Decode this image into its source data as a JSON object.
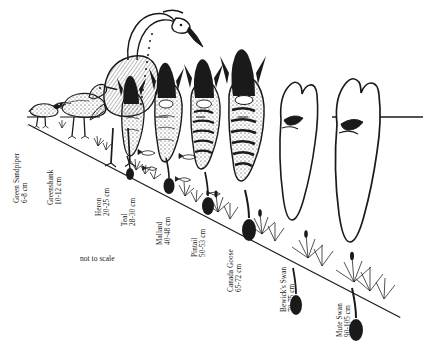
{
  "figure": {
    "note": "not to scale",
    "note_label": "scale-note",
    "ink_color": "#1a1a1a",
    "background_color": "#ffffff"
  },
  "birds": [
    {
      "id": "green-sandpiper",
      "name": "Green Sandpiper",
      "size": "6-8 cm",
      "size_min_cm": 6,
      "size_max_cm": 8,
      "order": 1
    },
    {
      "id": "greenshank",
      "name": "Greenshank",
      "size": "10-12 cm",
      "size_min_cm": 10,
      "size_max_cm": 12,
      "order": 2
    },
    {
      "id": "heron",
      "name": "Heron",
      "size": "20-25 cm",
      "size_min_cm": 20,
      "size_max_cm": 25,
      "order": 3
    },
    {
      "id": "teal",
      "name": "Teal",
      "size": "28-30 cm",
      "size_min_cm": 28,
      "size_max_cm": 30,
      "order": 4
    },
    {
      "id": "mallard",
      "name": "Mallard",
      "size": "40-48 cm",
      "size_min_cm": 40,
      "size_max_cm": 48,
      "order": 5
    },
    {
      "id": "pintail",
      "name": "Pintail",
      "size": "50-53 cm",
      "size_min_cm": 50,
      "size_max_cm": 53,
      "order": 6
    },
    {
      "id": "canada-goose",
      "name": "Canada Goose",
      "size": "65-72 cm",
      "size_min_cm": 65,
      "size_max_cm": 72,
      "order": 7
    },
    {
      "id": "bewicks-swan",
      "name": "Bewick's Swan",
      "size": "70-75 cm",
      "size_min_cm": 70,
      "size_max_cm": 75,
      "order": 8
    },
    {
      "id": "mute-swan",
      "name": "Mute Swan",
      "size": "90-105 cm",
      "size_min_cm": 90,
      "size_max_cm": 105,
      "order": 9
    }
  ]
}
